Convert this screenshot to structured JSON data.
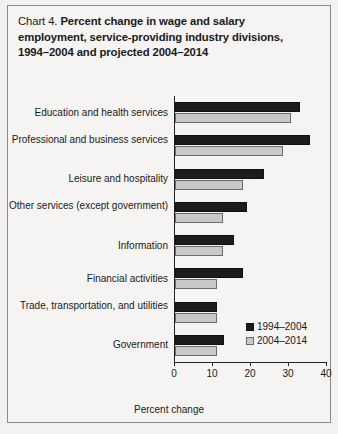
{
  "figure": {
    "label": "Chart 4.",
    "title_line1": "Percent change in wage and salary",
    "title_line2": "employment, service-providing industry divisions,",
    "title_line3": "1994–2004 and projected 2004–2014"
  },
  "legend": {
    "position": "inside-bottom-right",
    "entries": [
      {
        "name": "1994–2004",
        "color": "#1c1c1c"
      },
      {
        "name": "2004–2014",
        "color": "#c9c9c7"
      }
    ]
  },
  "chart_data": {
    "type": "bar",
    "orientation": "horizontal",
    "title": "Chart 4. Percent change in wage and salary employment, service-providing industry divisions, 1994–2004 and projected 2004–2014",
    "xlabel": "Percent change",
    "ylabel": "",
    "xlim": [
      0,
      40
    ],
    "xticks": [
      0,
      10,
      20,
      30,
      40
    ],
    "xtick_labels": [
      "0",
      "10",
      "20",
      "30",
      "40"
    ],
    "grid": false,
    "categories": [
      "Education and health services",
      "Professional and business services",
      "Leisure and hospitality",
      "Other services (except government)",
      "Information",
      "Financial activities",
      "Trade, transportation, and utilities",
      "Government"
    ],
    "series": [
      {
        "name": "1994–2004",
        "color": "#1c1c1c",
        "values": [
          33.0,
          35.5,
          23.5,
          19.0,
          15.5,
          18.0,
          11.0,
          13.0
        ]
      },
      {
        "name": "2004–2014",
        "color": "#c9c9c7",
        "values": [
          30.5,
          28.5,
          18.0,
          12.5,
          12.5,
          11.0,
          11.0,
          11.0
        ]
      }
    ]
  }
}
